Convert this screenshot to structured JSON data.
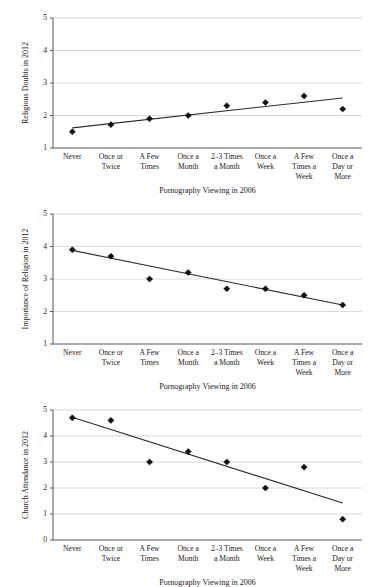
{
  "figure": {
    "shared_xlabel": "Pornography Viewing in 2006",
    "categories": [
      "Never",
      "Once or Twice",
      "A Few Times",
      "Once a Month",
      "2–3 Times a Month",
      "Once a Week",
      "A Few Times a Week",
      "Once a Day or More"
    ]
  },
  "chart_data": [
    {
      "type": "scatter",
      "id": "religious-doubts",
      "title": "",
      "xlabel": "Pornography Viewing in 2006",
      "ylabel": "Religious Doubts in 2012",
      "categories": [
        "Never",
        "Once or Twice",
        "A Few Times",
        "Once a Month",
        "2–3 Times a Month",
        "Once a Week",
        "A Few Times a Week",
        "Once a Day or More"
      ],
      "values": [
        1.5,
        1.72,
        1.9,
        2.0,
        2.3,
        2.4,
        2.6,
        2.2
      ],
      "ylim": [
        1,
        5
      ],
      "yticks": [
        1,
        2,
        3,
        4,
        5
      ],
      "grid": true,
      "legend": "none",
      "trend": {
        "type": "linear-fit",
        "start_value": 1.62,
        "end_value": 2.54
      }
    },
    {
      "type": "scatter",
      "id": "importance-of-religion",
      "title": "",
      "xlabel": "Pornography Viewing in 2006",
      "ylabel": "Importance of Religion in 2012",
      "categories": [
        "Never",
        "Once or Twice",
        "A Few Times",
        "Once a Month",
        "2–3 Times a Month",
        "Once a Week",
        "A Few Times a Week",
        "Once a Day or More"
      ],
      "values": [
        3.9,
        3.7,
        3.0,
        3.2,
        2.7,
        2.7,
        2.5,
        2.2
      ],
      "ylim": [
        1,
        5
      ],
      "yticks": [
        1,
        2,
        3,
        4,
        5
      ],
      "grid": true,
      "legend": "none",
      "trend": {
        "type": "linear-fit",
        "start_value": 3.88,
        "end_value": 2.2
      }
    },
    {
      "type": "scatter",
      "id": "church-attendance",
      "title": "",
      "xlabel": "Pornography Viewing in 2006",
      "ylabel": "Church Attendance in 2012",
      "categories": [
        "Never",
        "Once or Twice",
        "A Few Times",
        "Once a Month",
        "2–3 Times a Month",
        "Once a Week",
        "A Few Times a Week",
        "Once a Day or More"
      ],
      "values": [
        4.7,
        4.6,
        3.0,
        3.4,
        3.0,
        2.0,
        2.8,
        0.8
      ],
      "ylim": [
        0,
        5
      ],
      "yticks": [
        0,
        1,
        2,
        3,
        4,
        5
      ],
      "grid": true,
      "legend": "none",
      "trend": {
        "type": "linear-fit",
        "start_value": 4.72,
        "end_value": 1.42
      }
    }
  ],
  "colors": {
    "marker": "#111111",
    "trend_line": "#2b2b2b",
    "gridline": "#c9c9c9",
    "axis": "#595959",
    "text": "#1a1a1a",
    "background": "#ffffff"
  }
}
